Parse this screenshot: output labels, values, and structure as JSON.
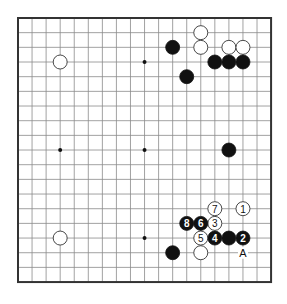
{
  "board": {
    "size": 19,
    "origin_x": 18,
    "origin_y": 18,
    "cell_w": 14.06,
    "cell_h": 14.67,
    "stone_radius": 7,
    "colors": {
      "background": "#ffffff",
      "grid": "#8a8a8a",
      "border": "#333333",
      "black_stone": "#111111",
      "white_stone": "#ffffff"
    }
  },
  "star_points": [
    {
      "col": 3,
      "row": 3
    },
    {
      "col": 9,
      "row": 3
    },
    {
      "col": 3,
      "row": 9
    },
    {
      "col": 9,
      "row": 9
    },
    {
      "col": 9,
      "row": 15
    }
  ],
  "stones": [
    {
      "color": "white",
      "col": 13,
      "row": 1,
      "label": ""
    },
    {
      "color": "black",
      "col": 11,
      "row": 2,
      "label": ""
    },
    {
      "color": "white",
      "col": 13,
      "row": 2,
      "label": ""
    },
    {
      "color": "white",
      "col": 15,
      "row": 2,
      "label": ""
    },
    {
      "color": "white",
      "col": 16,
      "row": 2,
      "label": ""
    },
    {
      "color": "white",
      "col": 3,
      "row": 3,
      "label": ""
    },
    {
      "color": "black",
      "col": 14,
      "row": 3,
      "label": ""
    },
    {
      "color": "black",
      "col": 15,
      "row": 3,
      "label": ""
    },
    {
      "color": "black",
      "col": 16,
      "row": 3,
      "label": ""
    },
    {
      "color": "black",
      "col": 12,
      "row": 4,
      "label": ""
    },
    {
      "color": "black",
      "col": 15,
      "row": 9,
      "label": ""
    },
    {
      "color": "white",
      "col": 16,
      "row": 13,
      "label": "1"
    },
    {
      "color": "black",
      "col": 16,
      "row": 15,
      "label": "2"
    },
    {
      "color": "white",
      "col": 14,
      "row": 14,
      "label": "3"
    },
    {
      "color": "black",
      "col": 14,
      "row": 15,
      "label": "4"
    },
    {
      "color": "white",
      "col": 13,
      "row": 15,
      "label": "5"
    },
    {
      "color": "black",
      "col": 13,
      "row": 14,
      "label": "6"
    },
    {
      "color": "white",
      "col": 14,
      "row": 13,
      "label": "7"
    },
    {
      "color": "black",
      "col": 12,
      "row": 14,
      "label": "8"
    },
    {
      "color": "black",
      "col": 15,
      "row": 15,
      "label": ""
    },
    {
      "color": "white",
      "col": 3,
      "row": 15,
      "label": ""
    },
    {
      "color": "black",
      "col": 11,
      "row": 16,
      "label": ""
    },
    {
      "color": "white",
      "col": 13,
      "row": 16,
      "label": ""
    }
  ],
  "markers": [
    {
      "text": "A",
      "col": 16,
      "row": 16
    }
  ]
}
